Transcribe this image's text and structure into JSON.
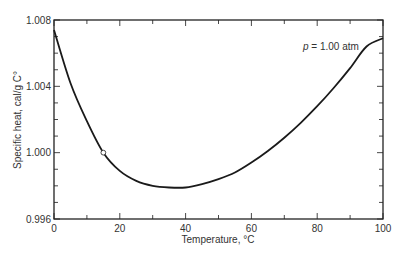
{
  "chart_data": {
    "type": "line",
    "title": "",
    "xlabel": "Temperature, °C",
    "ylabel": "Specific heat, cal/g C°",
    "annotation": "p = 1.00 atm",
    "annotation_var": "p",
    "annotation_rest": " = 1.00 atm",
    "xlim": [
      0,
      100
    ],
    "ylim": [
      0.996,
      1.008
    ],
    "x_ticks": [
      0,
      20,
      40,
      60,
      80,
      100
    ],
    "x_tick_labels": [
      "0",
      "20",
      "40",
      "60",
      "80",
      "100"
    ],
    "x_minor_step": 10,
    "y_ticks": [
      0.996,
      1.0,
      1.004,
      1.008
    ],
    "y_tick_labels": [
      "0.996",
      "1.000",
      "1.004",
      "1.008"
    ],
    "y_minor_step": 0.001,
    "grid": false,
    "legend": null,
    "series": [
      {
        "name": "Specific heat of water",
        "x": [
          0,
          5,
          10,
          15,
          20,
          25,
          30,
          35,
          40,
          45,
          50,
          55,
          60,
          65,
          70,
          75,
          80,
          85,
          90,
          95,
          100
        ],
        "values": [
          1.0074,
          1.0042,
          1.0019,
          1.0,
          0.9989,
          0.9983,
          0.998,
          0.9979,
          0.9979,
          0.9981,
          0.9984,
          0.9988,
          0.9994,
          1.0001,
          1.0009,
          1.0018,
          1.0028,
          1.0039,
          1.0051,
          1.0064,
          1.0069
        ]
      }
    ],
    "marker": {
      "x": 15,
      "y": 1.0,
      "style": "open-circle"
    }
  }
}
